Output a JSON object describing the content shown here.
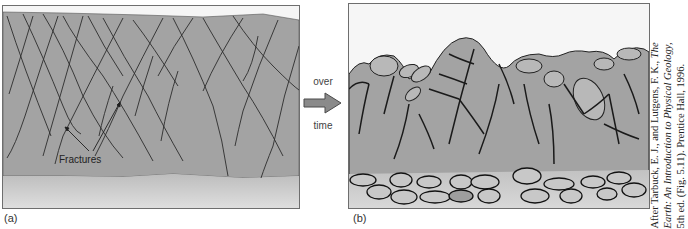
{
  "figure": {
    "panel_a": {
      "label": "(a)",
      "annotation": "Fractures",
      "description": "Fractured bedrock layer above soil/sediment base"
    },
    "transition": {
      "word_top": "over",
      "word_bottom": "time",
      "icon": "right-arrow-icon"
    },
    "panel_b": {
      "label": "(b)",
      "description": "Weathered bedrock with rounded blocks and talus debris at base"
    },
    "citation": {
      "line1_prefix": "After Tarbuck, E. J., and Lutgens, F. K., ",
      "line1_italic": "The",
      "line2_italic": "Earth: An Introduction to Physical Geology,",
      "line3": "5th ed. (Fig. 5.11). Prentice Hall, 1996."
    },
    "colors": {
      "rock": "#a3a3a3",
      "rock_dark": "#8f8f8f",
      "sediment": "#cfcfcf",
      "boulder": "#b5b5b5",
      "fracture": "#2a2a2a",
      "arrow": "#8a8a8a"
    }
  }
}
